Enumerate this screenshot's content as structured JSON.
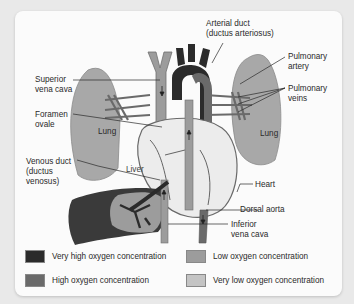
{
  "diagram": {
    "labels": {
      "arterial_duct": "Arterial duct\n(ductus arteriosus)",
      "superior_vena_cava": "Superior\nvena cava",
      "foramen_ovale": "Foramen\novale",
      "pulmonary_artery": "Pulmonary\nartery",
      "pulmonary_veins": "Pulmonary\nveins",
      "lung_left": "Lung",
      "lung_right": "Lung",
      "venous_duct": "Venous duct\n(ductus\nvenosus)",
      "liver": "Liver",
      "heart": "Heart",
      "dorsal_aorta": "Dorsal aorta",
      "inferior_vena_cava": "Inferior\nvena cava"
    },
    "legend": [
      {
        "label": "Very high oxygen concentration",
        "color": "#2b2b2b"
      },
      {
        "label": "High oxygen concentration",
        "color": "#6a6a6a"
      },
      {
        "label": "Low oxygen concentration",
        "color": "#9c9c9c"
      },
      {
        "label": "Very low oxygen concentration",
        "color": "#c4c4c4"
      }
    ]
  }
}
